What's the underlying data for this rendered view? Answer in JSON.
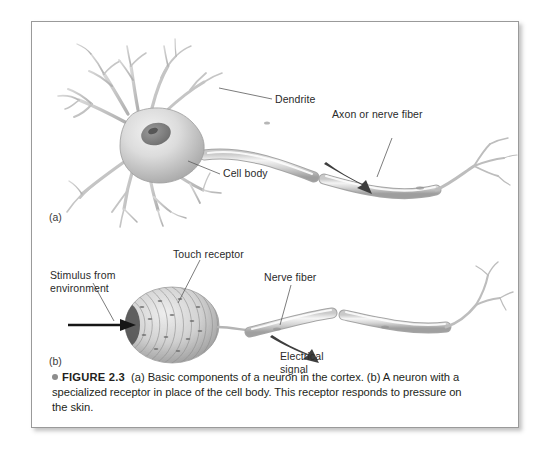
{
  "figure": {
    "caption": {
      "bullet_icon": "round-bullet",
      "label": "FIGURE 2.3",
      "text": "(a) Basic components of a neuron in the cortex. (b) A neuron with a specialized receptor in place of the cell body. This receptor responds to pressure on the skin."
    },
    "panels": [
      {
        "id": "a",
        "letter": "(a)",
        "subject": "Basic components of a neuron in the cortex",
        "labels": [
          {
            "name": "dendrite",
            "text": "Dendrite"
          },
          {
            "name": "cell-body",
            "text": "Cell body"
          },
          {
            "name": "axon",
            "text": "Axon or nerve fiber"
          }
        ],
        "parts": [
          "cell-body",
          "nucleus",
          "dendrites",
          "axon",
          "myelin-segments",
          "axon-terminals",
          "signal-direction-arrow"
        ]
      },
      {
        "id": "b",
        "letter": "(b)",
        "subject": "A neuron with a specialized receptor in place of the cell body",
        "labels": [
          {
            "name": "touch-receptor",
            "text": "Touch receptor"
          },
          {
            "name": "stimulus",
            "text": "Stimulus from\nenvironment"
          },
          {
            "name": "nerve-fiber",
            "text": "Nerve fiber"
          },
          {
            "name": "electrical-signal",
            "text": "Electrical\nsignal"
          }
        ],
        "parts": [
          "touch-receptor",
          "stimulus-arrow",
          "nerve-fiber",
          "myelin-segments",
          "nerve-endings",
          "signal-direction-arrow"
        ]
      }
    ],
    "colors": {
      "page_background": "#ffffff",
      "page_border": "#9a9a9a",
      "label_text": "#2a2a2a",
      "caption_text": "#231f20",
      "artwork_gray": "#b9b9b9",
      "arrow_dark": "#3c3c3c"
    }
  }
}
